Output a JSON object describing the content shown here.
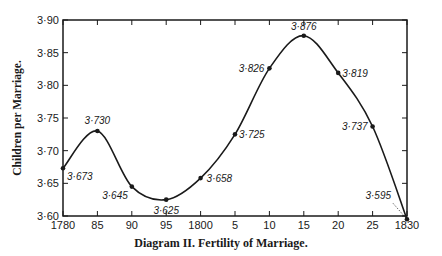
{
  "chart_data": {
    "type": "line",
    "title": "Diagram II.   Fertility of Marriage.",
    "xlabel": "",
    "ylabel": "Children per Marriage.",
    "x": [
      1780,
      1785,
      1790,
      1795,
      1800,
      1805,
      1810,
      1815,
      1820,
      1825,
      1830
    ],
    "x_tick_labels": [
      "1780",
      "85",
      "90",
      "95",
      "1800",
      "5",
      "10",
      "15",
      "20",
      "25",
      "1830"
    ],
    "y_tick_labels": [
      "3·60",
      "3·65",
      "3·70",
      "3·75",
      "3·80",
      "3·85",
      "3·90"
    ],
    "ylim": [
      3.6,
      3.9
    ],
    "xlim": [
      1780,
      1830
    ],
    "grid": false,
    "series": [
      {
        "name": "Children per Marriage",
        "values": [
          3.673,
          3.73,
          3.645,
          3.625,
          3.658,
          3.725,
          3.826,
          3.876,
          3.819,
          3.737,
          3.595
        ],
        "labels": [
          "3·673",
          "3·730",
          "3·645",
          "3·625",
          "3·658",
          "3·725",
          "3·826",
          "3·876",
          "3·819",
          "3·737",
          "3·595"
        ]
      }
    ],
    "legend": null
  },
  "caption": "Diagram II.   Fertility of Marriage.",
  "ylabel": "Children per Marriage."
}
